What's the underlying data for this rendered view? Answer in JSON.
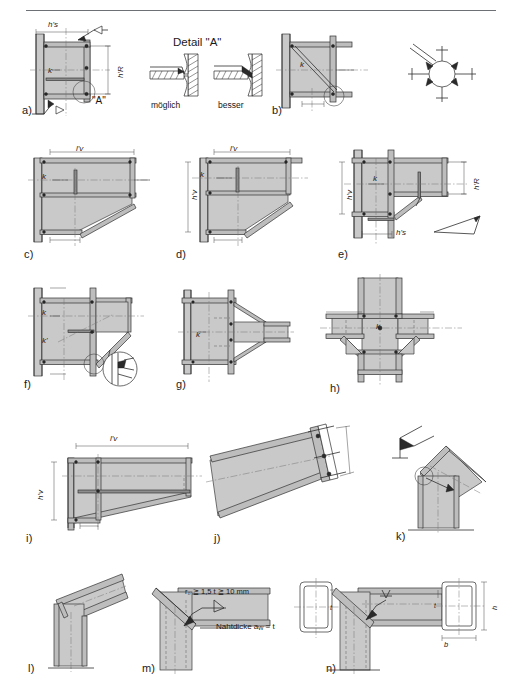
{
  "figure": {
    "title": "Detail \"A\"",
    "top_rule": true,
    "background": "#ffffff",
    "steel_fill": "#c9c9c9",
    "line_color": "#2d2d2d"
  },
  "detail_panel": {
    "title": "Detail \"A\"",
    "options": [
      {
        "key": "moeglich",
        "label": "möglich"
      },
      {
        "key": "besser",
        "label": "besser"
      }
    ]
  },
  "captions": [
    {
      "id": "a",
      "label": "a)"
    },
    {
      "id": "b",
      "label": "b)"
    },
    {
      "id": "c",
      "label": "c)"
    },
    {
      "id": "d",
      "label": "d)"
    },
    {
      "id": "e",
      "label": "e)"
    },
    {
      "id": "f",
      "label": "f)"
    },
    {
      "id": "g",
      "label": "g)"
    },
    {
      "id": "h",
      "label": "h)"
    },
    {
      "id": "i",
      "label": "i)"
    },
    {
      "id": "j",
      "label": "j)"
    },
    {
      "id": "k",
      "label": "k)"
    },
    {
      "id": "l",
      "label": "l)"
    },
    {
      "id": "m",
      "label": "m)"
    },
    {
      "id": "n",
      "label": "n)"
    }
  ],
  "labels": {
    "h_s": "h's",
    "h_R": "h'R",
    "h_v": "h'v",
    "l_v": "l'v",
    "k": "k",
    "k_prime": "k'",
    "a_callout": "\"A\"",
    "b_dim": "b",
    "h_dim": "h",
    "t_dim": "t"
  },
  "annotations": {
    "radius_note": "r₀ ≧ 1,5 t ≧ 10 mm",
    "weld_thickness_note": "Nahtdicke aᵥᵥ = t",
    "weld_thickness_plain": "Nahtdicke a",
    "weld_thickness_sub": "w",
    "weld_thickness_tail": "= t"
  },
  "figure_notes": {
    "a": "Stirnplattenstoß mit Voute, Detail A",
    "b": "Diagonalsteife im Rahmeneck",
    "c": "Voute mit Rippe",
    "d": "Voute mit Untergurt",
    "e": "Riegelansatz mit kurzer Voute",
    "f": "Voute mit Schrägsteife",
    "g": "Symmetrischer Riegelanschluss",
    "h": "Kreuzknoten vierseitig",
    "i": "Langvoute am Riegel",
    "j": "Geneigter Riegel mit Stirnplatte",
    "k": "Firstpunkt mit Knick",
    "l": "Geschweisstes Rahmeneck",
    "m": "Hohlprofilecke mit Ausrundung",
    "n": "Hohlprofilecke gehrungsgeschweisst"
  }
}
